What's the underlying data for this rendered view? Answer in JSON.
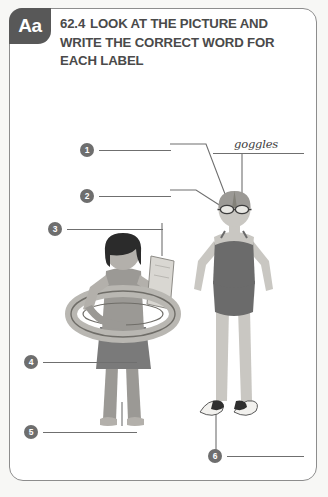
{
  "worksheet": {
    "badge_label": "Aa",
    "task_number": "62.4",
    "instruction": "LOOK AT THE PICTURE AND WRITE THE CORRECT WORD FOR EACH LABEL"
  },
  "labels": [
    {
      "number": "1",
      "answer": ""
    },
    {
      "number": "2",
      "answer": ""
    },
    {
      "number": "3",
      "answer": ""
    },
    {
      "number": "4",
      "answer": ""
    },
    {
      "number": "5",
      "answer": ""
    },
    {
      "number": "6",
      "answer": ""
    }
  ],
  "example_answer": {
    "text": "goggles"
  },
  "colors": {
    "badge_background": "#585858",
    "badge_text": "#ffffff",
    "instruction_text": "#4a4a4a",
    "marker_fill": "#6e6e6e",
    "line_stroke": "#6f6f6f",
    "card_border": "#8d8d8d",
    "skin": "#c9c7c2",
    "skin_shade": "#b3b0ab",
    "hair_dark": "#2b2b2b",
    "swimsuit": "#6b6b6b",
    "skirt": "#7a7a7a",
    "towel_light": "#e3e1dc",
    "ring_light": "#d7d5d0",
    "flipper_dark": "#2f2f2f"
  }
}
